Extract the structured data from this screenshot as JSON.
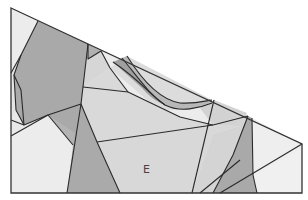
{
  "diagram": {
    "labels": [
      {
        "id": "region-e",
        "text": "E"
      }
    ],
    "palette": {
      "dark": "#a9a9a9",
      "mid": "#c4c4c4",
      "light": "#d9d9d9",
      "lightest": "#ececec",
      "stroke": "#2a2a2a"
    },
    "regions": [
      {
        "id": "top-left-sliver",
        "tone": "lightest"
      },
      {
        "id": "left-large-dark",
        "tone": "dark"
      },
      {
        "id": "left-mid-light",
        "tone": "lightest"
      },
      {
        "id": "bottom-left-light",
        "tone": "lightest"
      },
      {
        "id": "left-lower-dark",
        "tone": "dark"
      },
      {
        "id": "center-lower-dark",
        "tone": "dark"
      },
      {
        "id": "center-upper-light",
        "tone": "light"
      },
      {
        "id": "region-e",
        "tone": "light"
      },
      {
        "id": "curved-band-dark",
        "tone": "dark"
      },
      {
        "id": "curved-band-mid",
        "tone": "mid"
      },
      {
        "id": "top-center-light",
        "tone": "light"
      },
      {
        "id": "right-center-light",
        "tone": "light"
      },
      {
        "id": "right-dark-strip",
        "tone": "dark"
      },
      {
        "id": "right-end-light",
        "tone": "lightest"
      },
      {
        "id": "bottom-right-light",
        "tone": "lightest"
      }
    ]
  }
}
